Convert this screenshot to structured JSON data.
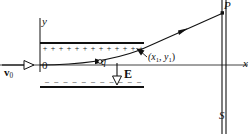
{
  "figure": {
    "colors": {
      "ink": "#111111",
      "background": "#ffffff"
    },
    "labels": {
      "y_axis": "y",
      "origin": "0",
      "x_axis": "x",
      "initial_velocity": "v",
      "initial_velocity_sub": "0",
      "charge": "q",
      "field": "E",
      "exit_point_open": "(x",
      "exit_point_sub1": "1",
      "exit_point_comma": ", y",
      "exit_point_sub2": "1",
      "exit_point_close": ")",
      "screen_point": "P",
      "screen": "S"
    },
    "plates": {
      "top_sign": "+",
      "top_sign_count": 13,
      "bottom_sign": "–",
      "bottom_sign_count": 11
    },
    "geometry": {
      "origin_px": [
        40,
        65
      ],
      "exit_point_px": [
        140,
        50
      ],
      "screen_x_px": [
        222,
        226
      ],
      "top_plate_y_px": 43,
      "bottom_plate_y_px": 87
    }
  }
}
